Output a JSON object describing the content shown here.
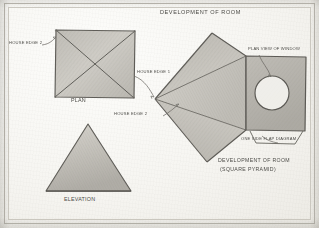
{
  "sheet": {
    "medium": "pencil on paper",
    "border_color": "#b9b6ae",
    "paper_color": "#f6f5f1",
    "graphite_color": "#6f6d68"
  },
  "title": "DEVELOPMENT OF ROOM",
  "figures": {
    "plan": {
      "label": "PLAN",
      "shape": "square with diagonals",
      "annotations": [
        {
          "text": "HOUSE EDGE 2",
          "side": "left"
        }
      ]
    },
    "elevation": {
      "label": "ELEVATION",
      "shape": "triangle"
    },
    "development": {
      "label_line1": "DEVELOPMENT OF ROOM",
      "label_line2": "(SQUARE PYRAMID)",
      "shape": "fan of triangles with square flap",
      "annotations": [
        {
          "text": "PLAN VIEW OF WINDOW",
          "side": "top"
        },
        {
          "text": "ONE SIDE FLAP DIAGRAM",
          "side": "bottom"
        }
      ]
    }
  },
  "callouts": {
    "house_edge_1": "HOUSE EDGE 1",
    "house_edge_2": "HOUSE EDGE 2",
    "house_edge_2_plan": "HOUSE EDGE 2"
  }
}
